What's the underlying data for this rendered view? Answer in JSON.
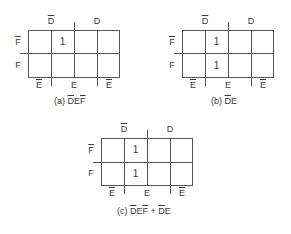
{
  "maps": [
    {
      "id": "a",
      "top_labels": {
        "left": "D",
        "left_negated": true,
        "right": "D"
      },
      "side_labels": {
        "top": "F",
        "top_negated": true,
        "bottom": "F"
      },
      "bottom_labels": {
        "left": "E",
        "middle": "E",
        "right": "E"
      },
      "cells": [
        [
          "",
          "1",
          "",
          ""
        ],
        [
          "",
          "",
          "",
          ""
        ]
      ],
      "caption_prefix": "(a) ",
      "caption_terms": [
        {
          "text": "D",
          "neg": true
        },
        {
          "text": "E",
          "neg": false
        },
        {
          "text": "F",
          "neg": true
        }
      ]
    },
    {
      "id": "b",
      "top_labels": {
        "left": "D",
        "left_negated": true,
        "right": "D"
      },
      "side_labels": {
        "top": "F",
        "top_negated": true,
        "bottom": "F"
      },
      "bottom_labels": {
        "left": "E",
        "middle": "E",
        "right": "E"
      },
      "cells": [
        [
          "",
          "1",
          "",
          ""
        ],
        [
          "",
          "1",
          "",
          ""
        ]
      ],
      "caption_prefix": "(b) ",
      "caption_terms": [
        {
          "text": "D",
          "neg": true
        },
        {
          "text": "E",
          "neg": false
        }
      ]
    },
    {
      "id": "c",
      "top_labels": {
        "left": "D",
        "left_negated": true,
        "right": "D"
      },
      "side_labels": {
        "top": "F",
        "top_negated": true,
        "bottom": "F"
      },
      "bottom_labels": {
        "left": "E",
        "middle": "E",
        "right": "E"
      },
      "cells": [
        [
          "",
          "1",
          "",
          ""
        ],
        [
          "",
          "1",
          "",
          ""
        ]
      ],
      "caption_prefix": "(c) ",
      "caption_terms": [
        {
          "text": "D",
          "neg": true
        },
        {
          "text": "E",
          "neg": false
        },
        {
          "text": "F",
          "neg": true
        },
        {
          "text": " + ",
          "neg": false
        },
        {
          "text": "D",
          "neg": true
        },
        {
          "text": "E",
          "neg": false
        }
      ]
    }
  ]
}
